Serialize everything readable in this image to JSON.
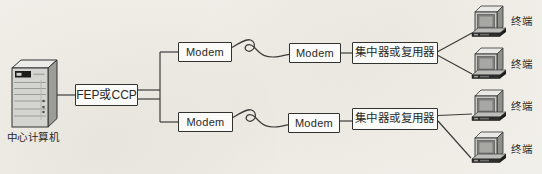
{
  "colors": {
    "bg": "#f1efe9",
    "line": "#3c3c3a",
    "box_fill": "#fbfbf9",
    "box_border": "#32322f",
    "text": "#292926"
  },
  "nodes": {
    "central_computer": {
      "label": "中心计算机",
      "icon": "server-tower-icon"
    },
    "fep": {
      "label": "FEP或CCP"
    },
    "top_branch": {
      "modem_near": {
        "label": "Modem"
      },
      "modem_far": {
        "label": "Modem"
      },
      "concentrator": {
        "label": "集中器或复用器"
      }
    },
    "bottom_branch": {
      "modem_near": {
        "label": "Modem"
      },
      "modem_far": {
        "label": "Modem"
      },
      "concentrator": {
        "label": "集中器或复用器"
      }
    },
    "terminals": [
      {
        "label": "终端",
        "icon": "terminal-icon"
      },
      {
        "label": "终端",
        "icon": "terminal-icon"
      },
      {
        "label": "终端",
        "icon": "terminal-icon"
      },
      {
        "label": "终端",
        "icon": "terminal-icon"
      }
    ]
  }
}
